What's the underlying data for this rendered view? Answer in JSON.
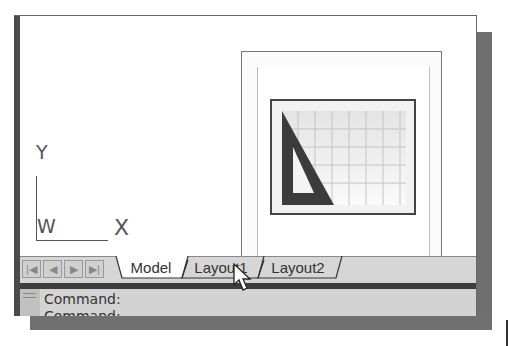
{
  "ucs": {
    "y_label": "Y",
    "w_label": "W",
    "x_label": "X"
  },
  "preview": {
    "icon": "layout-paper-space-icon",
    "grid_cols": 8,
    "grid_rows": 5
  },
  "tabs": {
    "nav_buttons": [
      {
        "name": "first-tab-button",
        "glyph": "|◀"
      },
      {
        "name": "prev-tab-button",
        "glyph": "◀"
      },
      {
        "name": "next-tab-button",
        "glyph": "▶"
      },
      {
        "name": "last-tab-button",
        "glyph": "▶|"
      }
    ],
    "items": [
      {
        "label": "Model",
        "active": true
      },
      {
        "label": "Layout1",
        "active": false
      },
      {
        "label": "Layout2",
        "active": false
      }
    ]
  },
  "command": {
    "line1": "Command:",
    "line2": "Command:"
  },
  "colors": {
    "window_shadow": "#6f6f6f",
    "tabbar_bg": "#d6d6d6",
    "separator": "#3d3d3d"
  }
}
